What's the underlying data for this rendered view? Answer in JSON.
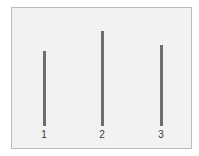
{
  "diagram": {
    "title": "",
    "background_color": "#f2f2f2",
    "border_color": "#bdbdbd",
    "line_color": "#6e6e6e",
    "lines": [
      {
        "label": "1",
        "x": 44,
        "top": 51,
        "bottom": 126
      },
      {
        "label": "2",
        "x": 102,
        "top": 31,
        "bottom": 126
      },
      {
        "label": "3",
        "x": 161,
        "top": 45,
        "bottom": 126
      }
    ]
  }
}
